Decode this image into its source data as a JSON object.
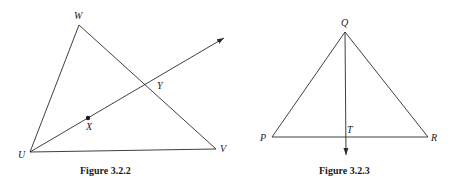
{
  "figures": [
    {
      "caption": "Figure 3.2.2",
      "labels": {
        "W": "W",
        "U": "U",
        "V": "V",
        "X": "X",
        "Y": "Y"
      },
      "description": "Triangle UVW with ray from U through X, crossing side WV at Y"
    },
    {
      "caption": "Figure 3.2.3",
      "labels": {
        "Q": "Q",
        "P": "P",
        "R": "R",
        "T": "T"
      },
      "description": "Triangle PQR with ray from Q through T on side PR"
    }
  ]
}
